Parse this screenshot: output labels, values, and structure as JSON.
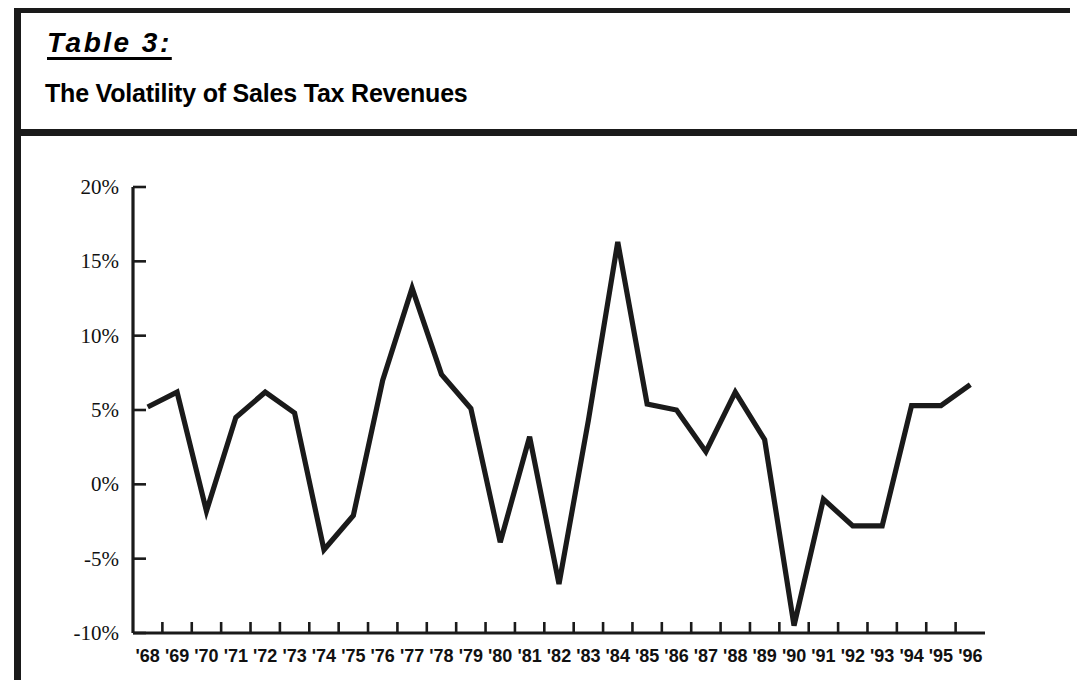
{
  "figure": {
    "label": "Table 3:",
    "subtitle": "The Volatility of Sales Tax Revenues"
  },
  "chart_data": {
    "type": "line",
    "title": "The Volatility of Sales Tax Revenues",
    "subtitle": "Table 3:",
    "xlabel": "",
    "ylabel": "",
    "grid": false,
    "legend": "none",
    "ylim": [
      -10,
      20
    ],
    "yticks": [
      20,
      15,
      10,
      5,
      0,
      -5,
      -10
    ],
    "ytick_labels": [
      "20%",
      "15%",
      "10%",
      "5%",
      "0%",
      "-5%",
      "-10%"
    ],
    "categories": [
      "'68",
      "'69",
      "'70",
      "'71",
      "'72",
      "'73",
      "'74",
      "'75",
      "'76",
      "'77",
      "'78",
      "'79",
      "'80",
      "'81",
      "'82",
      "'83",
      "'84",
      "'85",
      "'86",
      "'87",
      "'88",
      "'89",
      "'90",
      "'91",
      "'92",
      "'93",
      "'94",
      "'95",
      "'96"
    ],
    "values": [
      5.2,
      6.2,
      -1.8,
      4.5,
      6.2,
      4.8,
      -4.4,
      -2.1,
      7.0,
      13.2,
      7.4,
      5.1,
      -3.9,
      3.2,
      -6.7,
      4.3,
      16.3,
      5.4,
      5.0,
      2.2,
      6.2,
      3.0,
      -9.5,
      -1.0,
      -2.8,
      -2.8,
      5.3,
      5.3,
      6.7
    ],
    "series_color": "#1a1a1a"
  }
}
